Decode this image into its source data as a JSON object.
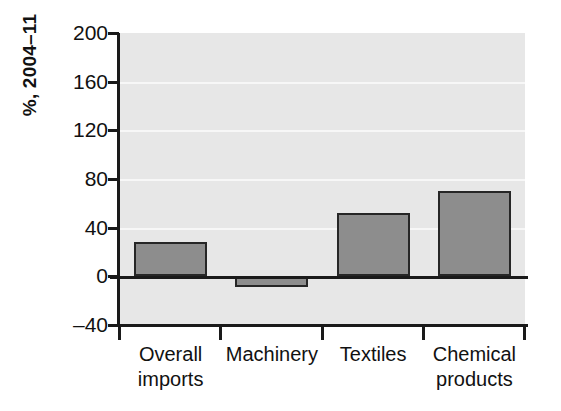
{
  "chart_data": {
    "type": "bar",
    "title": "",
    "subtitle": "",
    "xlabel": "",
    "ylabel": "%, 2004–11",
    "categories": [
      "Overall imports",
      "Machinery",
      "Textiles",
      "Chemical products"
    ],
    "values": [
      28,
      -9,
      52,
      70
    ],
    "series": [
      {
        "name": "Growth",
        "values": [
          28,
          -9,
          52,
          70
        ]
      }
    ],
    "ylim": [
      -40,
      200
    ],
    "ytick_labels": [
      "200",
      "160",
      "120",
      "80",
      "40",
      "0",
      "–40"
    ],
    "ytick_values": [
      200,
      160,
      120,
      80,
      40,
      0,
      -40
    ],
    "grid": true,
    "legend": "none",
    "bar_fill_color": "#8d8d8d",
    "bar_edge_color": "#262626",
    "plot_background_color": "#e7e7e7",
    "gridline_color": "#f7f7f7",
    "axis_color": "#1a1a1a",
    "page_background_color": "#ffffff"
  },
  "axis": {
    "y_title": "%, 2004–11"
  }
}
